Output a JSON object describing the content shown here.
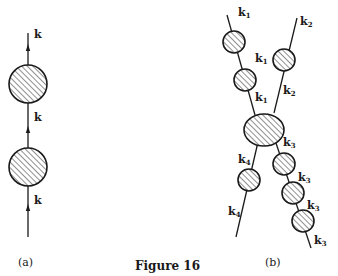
{
  "figure": {
    "title": "Figure 16",
    "panel_a": {
      "caption": "(a)",
      "labels": [
        "k",
        "k",
        "k"
      ],
      "line": {
        "x": 28,
        "y1": 33,
        "y2": 237
      },
      "blobs": [
        {
          "cx": 28,
          "cy": 84,
          "rx": 19,
          "ry": 19
        },
        {
          "cx": 28,
          "cy": 167,
          "rx": 19,
          "ry": 19
        }
      ],
      "arrows_y": [
        48,
        130,
        208
      ]
    },
    "panel_b": {
      "caption": "(b)",
      "label_main": "k",
      "labels": [
        {
          "sub": "1",
          "x": 238,
          "y": 16
        },
        {
          "sub": "1",
          "x": 255,
          "y": 62
        },
        {
          "sub": "1",
          "x": 255,
          "y": 101
        },
        {
          "sub": "2",
          "x": 300,
          "y": 25
        },
        {
          "sub": "2",
          "x": 283,
          "y": 94
        },
        {
          "sub": "4",
          "x": 238,
          "y": 163
        },
        {
          "sub": "4",
          "x": 228,
          "y": 215
        },
        {
          "sub": "3",
          "x": 283,
          "y": 146
        },
        {
          "sub": "3",
          "x": 298,
          "y": 181
        },
        {
          "sub": "3",
          "x": 307,
          "y": 209
        },
        {
          "sub": "3",
          "x": 314,
          "y": 244
        }
      ],
      "lines": [
        {
          "name": "k1",
          "x1": 227,
          "y1": 15,
          "x2": 255,
          "y2": 115
        },
        {
          "name": "k2",
          "x1": 297,
          "y1": 18,
          "x2": 274,
          "y2": 113
        },
        {
          "name": "k4",
          "x1": 258,
          "y1": 142,
          "x2": 236,
          "y2": 237
        },
        {
          "name": "k3",
          "x1": 276,
          "y1": 143,
          "x2": 311,
          "y2": 248
        }
      ],
      "blobs": [
        {
          "cx": 234,
          "cy": 42,
          "rx": 11,
          "ry": 11
        },
        {
          "cx": 245,
          "cy": 80,
          "rx": 11,
          "ry": 11
        },
        {
          "cx": 284,
          "cy": 60,
          "rx": 11,
          "ry": 11
        },
        {
          "cx": 264,
          "cy": 130,
          "rx": 20,
          "ry": 16
        },
        {
          "cx": 249,
          "cy": 180,
          "rx": 11,
          "ry": 11
        },
        {
          "cx": 284,
          "cy": 164,
          "rx": 11,
          "ry": 11
        },
        {
          "cx": 293,
          "cy": 193,
          "rx": 11,
          "ry": 11
        },
        {
          "cx": 303,
          "cy": 221,
          "rx": 11,
          "ry": 11
        }
      ]
    }
  }
}
